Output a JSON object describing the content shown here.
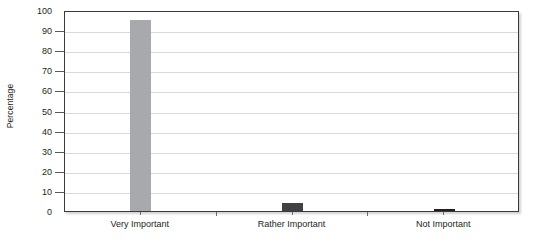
{
  "chart_data": {
    "type": "bar",
    "title": "",
    "xlabel": "",
    "ylabel": "Percentage",
    "categories": [
      "Very Important",
      "Rather Important",
      "Not Important"
    ],
    "values": [
      95,
      4,
      1
    ],
    "ylim": [
      0,
      100
    ],
    "ytick_step": 10,
    "yticks": [
      0,
      10,
      20,
      30,
      40,
      50,
      60,
      70,
      80,
      90,
      100
    ],
    "ytick_labels": [
      "0",
      "10",
      "20",
      "30",
      "40",
      "50",
      "60",
      "70",
      "80",
      "90",
      "100"
    ],
    "grid": true,
    "grid_axis": "y",
    "legend": false,
    "legend_position": "none",
    "series": [
      {
        "name": "Percentage",
        "values": [
          95,
          4,
          1
        ],
        "colors": [
          "#a7a9ac",
          "#414042",
          "#231f20"
        ]
      }
    ]
  },
  "style": {
    "bar_color_primary": "#a7a9ac",
    "bar_color_secondary": "#414042",
    "bar_color_tertiary": "#231f20",
    "gridline_color": "#d9d9d9",
    "axis_color": "#3b3b3b",
    "text_color": "#231f20",
    "background": "#ffffff"
  }
}
